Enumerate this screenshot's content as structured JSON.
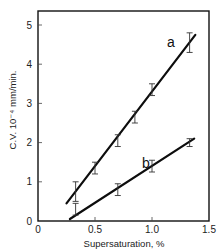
{
  "chart_data": {
    "type": "line",
    "title": "",
    "xlabel": "Supersaturation, %",
    "ylabel": "C.V. 10⁻⁴ mm/min.",
    "xlim": [
      0,
      1.5
    ],
    "ylim": [
      0,
      5.3
    ],
    "x_ticks": [
      "0",
      "0.5",
      "1.0",
      "1.5"
    ],
    "y_ticks": [
      "0",
      "1",
      "2",
      "3",
      "4",
      "5"
    ],
    "grid": false,
    "legend": "inline labels",
    "series": [
      {
        "name": "a",
        "fit_line": [
          [
            0.25,
            0.45
          ],
          [
            1.38,
            4.75
          ]
        ],
        "points": [
          {
            "x": 0.33,
            "y": 0.75,
            "err": 0.25
          },
          {
            "x": 0.5,
            "y": 1.35,
            "err": 0.15
          },
          {
            "x": 0.7,
            "y": 2.05,
            "err": 0.15
          },
          {
            "x": 0.85,
            "y": 2.65,
            "err": 0.15
          },
          {
            "x": 1.0,
            "y": 3.35,
            "err": 0.15
          },
          {
            "x": 1.33,
            "y": 4.55,
            "err": 0.25
          }
        ]
      },
      {
        "name": "b",
        "fit_line": [
          [
            0.28,
            0.05
          ],
          [
            1.37,
            2.1
          ]
        ],
        "points": [
          {
            "x": 0.33,
            "y": 0.3,
            "err": 0.15
          },
          {
            "x": 0.7,
            "y": 0.8,
            "err": 0.15
          },
          {
            "x": 1.0,
            "y": 1.4,
            "err": 0.15
          },
          {
            "x": 1.33,
            "y": 2.0,
            "err": 0.1
          }
        ]
      }
    ]
  },
  "labels": {
    "series_a": "a",
    "series_b": "b",
    "xlabel": "Supersaturation, %",
    "ylabel": "C.V. 10⁻⁴ mm/min."
  }
}
